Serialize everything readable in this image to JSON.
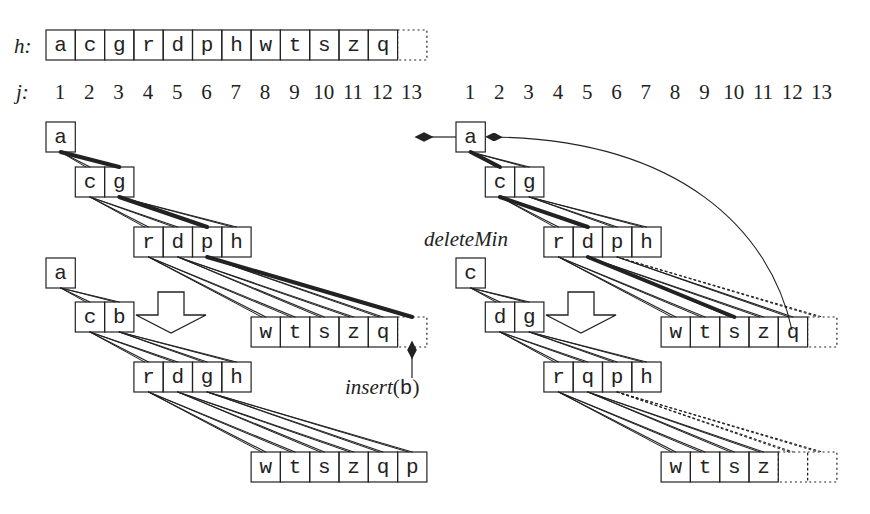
{
  "heap_array": {
    "label": "h:",
    "cells": [
      "a",
      "c",
      "g",
      "r",
      "d",
      "p",
      "h",
      "w",
      "t",
      "s",
      "z",
      "q",
      ""
    ]
  },
  "index_row": {
    "label": "j:",
    "left": [
      "1",
      "2",
      "3",
      "4",
      "5",
      "6",
      "7",
      "8",
      "9",
      "10",
      "11",
      "12",
      "13"
    ],
    "right": [
      "1",
      "2",
      "3",
      "4",
      "5",
      "6",
      "7",
      "8",
      "9",
      "10",
      "11",
      "12",
      "13"
    ]
  },
  "insert_panel": {
    "before": {
      "levels": [
        [
          "a"
        ],
        [
          "c",
          "g"
        ],
        [
          "r",
          "d",
          "p",
          "h"
        ],
        [
          "w",
          "t",
          "s",
          "z",
          "q"
        ]
      ],
      "empty_slot": true
    },
    "after": {
      "levels": [
        [
          "a"
        ],
        [
          "c",
          "b"
        ],
        [
          "r",
          "d",
          "g",
          "h"
        ],
        [
          "w",
          "t",
          "s",
          "z",
          "q",
          "p"
        ]
      ]
    },
    "operation_label": "insert",
    "operation_arg": "b",
    "paren_open": "(",
    "paren_close": ")"
  },
  "delete_panel": {
    "before": {
      "levels": [
        [
          "a"
        ],
        [
          "c",
          "g"
        ],
        [
          "r",
          "d",
          "p",
          "h"
        ],
        [
          "w",
          "t",
          "s",
          "z",
          "q"
        ]
      ],
      "empty_slot": true
    },
    "after": {
      "levels": [
        [
          "c"
        ],
        [
          "d",
          "g"
        ],
        [
          "r",
          "q",
          "p",
          "h"
        ],
        [
          "w",
          "t",
          "s",
          "z"
        ]
      ],
      "empty_slots": 2
    },
    "operation_label": "deleteMin"
  }
}
